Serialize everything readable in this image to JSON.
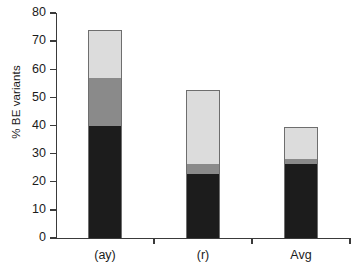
{
  "chart_data": {
    "type": "bar",
    "subtype": "stacked-bar",
    "title": "",
    "xlabel": "",
    "ylabel": "% BE variants",
    "categories": [
      "(ay)",
      "(r)",
      "Avg"
    ],
    "ylim": [
      0,
      80
    ],
    "yticks": [
      0,
      10,
      20,
      30,
      40,
      50,
      60,
      70,
      80
    ],
    "ytick_labels": [
      "0",
      "10",
      "20",
      "30",
      "40",
      "50",
      "60",
      "70",
      "80"
    ],
    "grid": false,
    "legend": "none",
    "series": [
      {
        "name": "dark-segment",
        "color": "#1c1c1c",
        "values": [
          40.0,
          23.0,
          26.5
        ]
      },
      {
        "name": "mid-gray-segment",
        "color": "#8a8a8a",
        "values": [
          17.0,
          3.5,
          2.0
        ]
      },
      {
        "name": "light-gray-segment",
        "color": "#dcdcdc",
        "values": [
          16.8,
          26.0,
          11.0
        ]
      }
    ],
    "totals": [
      73.8,
      52.5,
      39.5
    ]
  },
  "axes": {
    "y_title": "% BE variants",
    "y_tick_labels": [
      "80",
      "70",
      "60",
      "50",
      "40",
      "30",
      "20",
      "10",
      "0"
    ],
    "x_tick_labels": [
      "(ay)",
      "(r)",
      "Avg"
    ]
  },
  "colors": {
    "dark": "#1c1c1c",
    "mid": "#8a8a8a",
    "light": "#dcdcdc",
    "bar_border": "#6e6e6e",
    "axis": "#3a3a3a",
    "background": "#ffffff",
    "text": "#1b1b1b"
  }
}
